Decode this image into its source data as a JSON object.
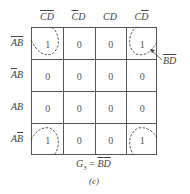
{
  "kmap": {
    "col_headers": [
      {
        "parts": [
          {
            "t": "C",
            "bar": true
          },
          {
            "t": "D",
            "bar": true
          }
        ]
      },
      {
        "parts": [
          {
            "t": "C",
            "bar": true
          },
          {
            "t": "D",
            "bar": false
          }
        ]
      },
      {
        "parts": [
          {
            "t": "C",
            "bar": false
          },
          {
            "t": "D",
            "bar": false
          }
        ]
      },
      {
        "parts": [
          {
            "t": "C",
            "bar": false
          },
          {
            "t": "D",
            "bar": true
          }
        ]
      }
    ],
    "row_headers": [
      {
        "parts": [
          {
            "t": "A",
            "bar": true
          },
          {
            "t": "B",
            "bar": true
          }
        ]
      },
      {
        "parts": [
          {
            "t": "A",
            "bar": true
          },
          {
            "t": "B",
            "bar": false
          }
        ]
      },
      {
        "parts": [
          {
            "t": "A",
            "bar": false
          },
          {
            "t": "B",
            "bar": false
          }
        ]
      },
      {
        "parts": [
          {
            "t": "A",
            "bar": false
          },
          {
            "t": "B",
            "bar": true
          }
        ]
      }
    ],
    "cells": [
      [
        "1",
        "0",
        "0",
        "1"
      ],
      [
        "0",
        "0",
        "0",
        "0"
      ],
      [
        "0",
        "0",
        "0",
        "0"
      ],
      [
        "1",
        "0",
        "0",
        "1"
      ]
    ],
    "group_label": {
      "parts": [
        {
          "t": "B",
          "bar": true
        },
        {
          "t": "D",
          "bar": true
        }
      ]
    },
    "group_color": "#444444"
  },
  "equation": {
    "lhs": "G",
    "sub": "3",
    "eq": " = ",
    "rhs": {
      "parts": [
        {
          "t": "B",
          "bar": true
        },
        {
          "t": "D",
          "bar": true
        }
      ]
    }
  },
  "caption": "(c)"
}
